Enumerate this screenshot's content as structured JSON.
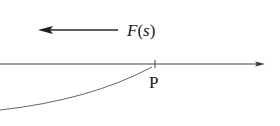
{
  "diagram": {
    "force_label": "F(s)",
    "force_label_parts": {
      "func": "F",
      "open": "(",
      "var": "s",
      "close": ")"
    },
    "point_label": "P",
    "colors": {
      "line": "#333333",
      "text": "#1a1a1a",
      "background": "#ffffff"
    }
  }
}
